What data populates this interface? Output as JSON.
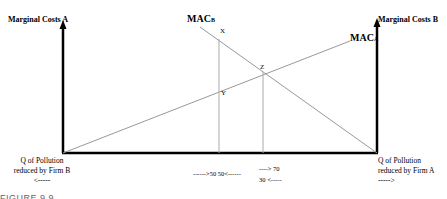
{
  "diagram": {
    "left_axis_label": "Marginal Costs A",
    "right_axis_label": "Marginal Costs B",
    "curve_b_label": "MAC",
    "curve_b_sub": "B",
    "curve_a_label": "MAC",
    "curve_a_sub": "A",
    "point_x": "X",
    "point_y": "Y",
    "point_z": "Z",
    "left_bottom_line1": "Q of Pollution",
    "left_bottom_line2": "reduced by Firm B",
    "left_bottom_arrow": "<-----",
    "right_bottom_line1": "Q of Pollution",
    "right_bottom_line2": "reduced by Firm A",
    "right_bottom_arrow": "----->",
    "tick_50": "------>50  50<------",
    "tick_70": "----> 70",
    "tick_30": "30 <-----",
    "figure_caption": "FIGURE 9.9"
  }
}
